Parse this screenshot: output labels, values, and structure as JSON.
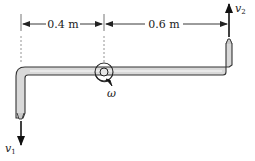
{
  "figure": {
    "dimensions": [
      {
        "label": "0.4 m",
        "from_x": 21,
        "to_x": 104
      },
      {
        "label": "0.6 m",
        "from_x": 104,
        "to_x": 229
      }
    ],
    "velocities": [
      {
        "symbol": "v",
        "subscript": "1",
        "direction": "down",
        "location": "left nozzle"
      },
      {
        "symbol": "v",
        "subscript": "2",
        "direction": "up",
        "location": "right nozzle"
      }
    ],
    "angular_velocity": {
      "symbol": "ω"
    },
    "colors": {
      "pipe_fill": "#d9d9d9",
      "pipe_outline": "#3a3a3a",
      "lines": "#222222",
      "dashed": "#777777"
    }
  }
}
